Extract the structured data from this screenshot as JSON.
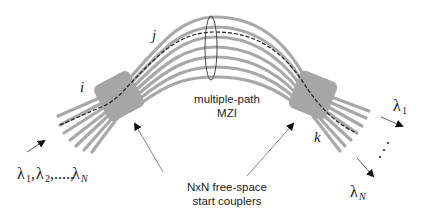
{
  "diagram": {
    "type": "photonic multiple-path Mach-Zehnder interferometer schematic",
    "labels": {
      "input_port": "i",
      "middle_path": "j",
      "output_port": "k",
      "mzi_label_line1": "multiple-path",
      "mzi_label_line2": "MZI",
      "coupler_label_line1": "NxN free-space",
      "coupler_label_line2": "start couplers",
      "input_wavelengths": {
        "lambda": "λ",
        "sub1": "1",
        "sub2": "2",
        "subN": "N",
        "sep": ",",
        "ellipsis": ",....,"
      },
      "output_lambda_1": {
        "lambda": "λ",
        "sub": "1"
      },
      "output_lambda_N": {
        "lambda": "λ",
        "sub": "N"
      },
      "output_dots": "⋰"
    },
    "components": [
      {
        "name": "left-star-coupler",
        "shape": "rounded rotated square"
      },
      {
        "name": "right-star-coupler",
        "shape": "rounded rotated square"
      },
      {
        "name": "arrayed-waveguides",
        "count": 7
      },
      {
        "name": "highlighted-path",
        "style": "dashed"
      },
      {
        "name": "mzi-ellipse-marker",
        "shape": "ellipse"
      }
    ],
    "colors": {
      "waveguide": "#a8a8a8",
      "coupler": "#a6a6a6",
      "dashed_path": "#222222",
      "arrow": "#333333",
      "text": "#222222"
    }
  }
}
